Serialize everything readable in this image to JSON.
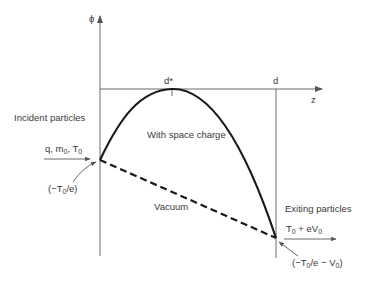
{
  "diagram": {
    "axes": {
      "y_label": "ϕ",
      "x_label": "z",
      "tick_peak": "d*",
      "tick_end": "d"
    },
    "curves": {
      "space_charge_label": "With space charge",
      "vacuum_label": "Vacuum"
    },
    "incident": {
      "title": "Incident particles",
      "params_q": "q, m",
      "params_m_sub": "0",
      "params_T": ", T",
      "params_T_sub": "0",
      "potential_prefix": "(−T",
      "potential_sub": "0",
      "potential_suffix": "/e)"
    },
    "exiting": {
      "title": "Exiting particles",
      "energy_T": "T",
      "energy_T_sub": "0",
      "energy_mid": " + eV",
      "energy_V_sub": "0",
      "potential_prefix": "(−T",
      "potential_sub": "0",
      "potential_mid": "/e − V",
      "potential_sub2": "0",
      "potential_suffix": ")"
    },
    "colors": {
      "curve": "#1a1a1a",
      "axis": "#6b6b6b",
      "text": "#3a3a3a"
    }
  }
}
